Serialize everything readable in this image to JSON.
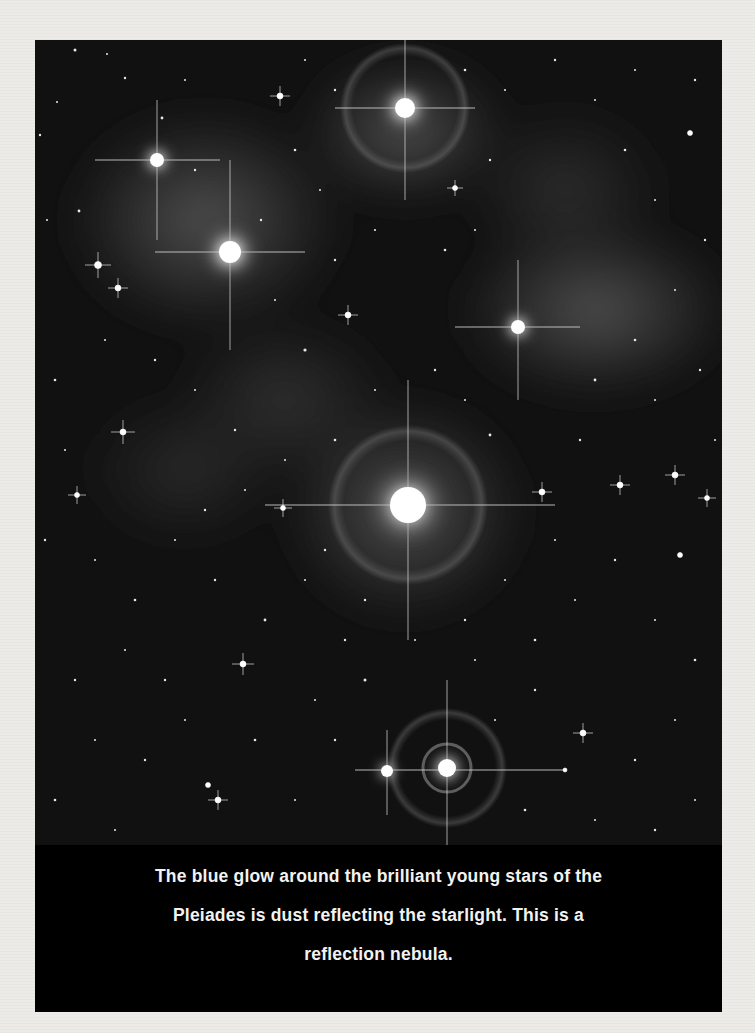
{
  "image": {
    "subject": "Pleiades star cluster reflection nebula",
    "style": "grayscale print scan",
    "colors": {
      "page_background": "#ecebe8",
      "photo_background": "#0b0b0b",
      "caption_background": "#000000",
      "caption_text": "#f2f2f2"
    },
    "bright_stars": [
      {
        "name": "star-top-center",
        "x": 370,
        "y": 68,
        "r": 22
      },
      {
        "name": "star-upper-left",
        "x": 122,
        "y": 120,
        "r": 14
      },
      {
        "name": "star-left-cluster",
        "x": 195,
        "y": 212,
        "r": 24
      },
      {
        "name": "star-right-nebula",
        "x": 483,
        "y": 287,
        "r": 14
      },
      {
        "name": "star-center",
        "x": 373,
        "y": 465,
        "r": 34
      },
      {
        "name": "star-bottom-ringed",
        "x": 412,
        "y": 728,
        "r": 18
      },
      {
        "name": "star-bottom-left-companion",
        "x": 352,
        "y": 731,
        "r": 10
      }
    ]
  },
  "caption": {
    "lines": [
      "The blue glow around the brilliant young stars of the",
      "Pleiades is dust reflecting the starlight. This is a",
      "reflection nebula."
    ]
  }
}
